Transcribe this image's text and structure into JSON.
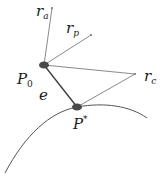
{
  "diagram": {
    "nodes": [
      {
        "id": "P0",
        "label": "P",
        "subscript": "0"
      },
      {
        "id": "Pstar",
        "label": "P",
        "superscript": "*"
      }
    ],
    "vectors": [
      {
        "id": "r_a",
        "label": "r",
        "subscript": "a",
        "from": "P0"
      },
      {
        "id": "r_p",
        "label": "r",
        "subscript": "p",
        "from": "P0"
      },
      {
        "id": "r_c",
        "label": "r",
        "subscript": "c",
        "from": "P0",
        "also_from": "Pstar"
      }
    ],
    "edges": [
      {
        "id": "e",
        "label": "e",
        "from": "P0",
        "to": "Pstar"
      }
    ],
    "curve": {
      "label": "",
      "passes_through": "Pstar"
    },
    "colors": {
      "node": "#4a4a4a",
      "edge": "#3a3a3a",
      "vector": "#8a8a8a",
      "curve": "#555555"
    }
  }
}
